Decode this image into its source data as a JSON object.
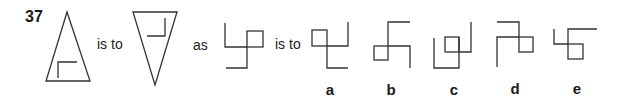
{
  "question": {
    "number": "37",
    "connectors": {
      "is_to_1": "is to",
      "as": "as",
      "is_to_2": "is to"
    },
    "figures": [
      {
        "id": "triangle-up",
        "description": "upward triangle with L-shape inside at bottom-left"
      },
      {
        "id": "triangle-down",
        "description": "downward triangle with reversed L-shape inside at top-right"
      },
      {
        "id": "stem",
        "description": "pinwheel-like line figure with square at top-right"
      }
    ],
    "options": [
      {
        "label": "a"
      },
      {
        "label": "b"
      },
      {
        "label": "c"
      },
      {
        "label": "d"
      },
      {
        "label": "e"
      }
    ]
  }
}
